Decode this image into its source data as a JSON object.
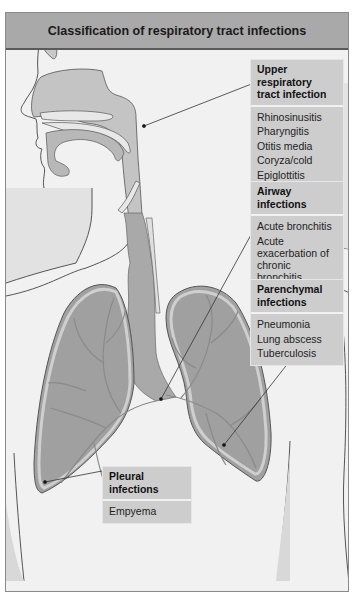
{
  "title": "Classification of respiratory tract infections",
  "categories": [
    {
      "id": "upper",
      "title": "Upper respiratory tract infection",
      "items": [
        "Rhinosinusitis",
        "Pharyngitis",
        "Otitis media",
        "Coryza/cold",
        "Epiglottitis",
        "Laryngitis"
      ]
    },
    {
      "id": "airway",
      "title": "Airway infections",
      "items": [
        "Acute bronchitis",
        "Acute exacerbation of chronic bronchitis",
        "Bronchiectasis",
        "Cystic fibrosis"
      ]
    },
    {
      "id": "parenchymal",
      "title": "Parenchymal infections",
      "items": [
        "Pneumonia",
        "Lung abscess",
        "Tuberculosis"
      ]
    },
    {
      "id": "pleural",
      "title": "Pleural infections",
      "items": [
        "Empyema"
      ]
    }
  ],
  "colors": {
    "header_bg": "#a9a9a9",
    "box_bg": "#cdcdcd",
    "lung": "#9f9f9f",
    "airway": "#c4c4c4",
    "background": "#f1f1f1"
  }
}
